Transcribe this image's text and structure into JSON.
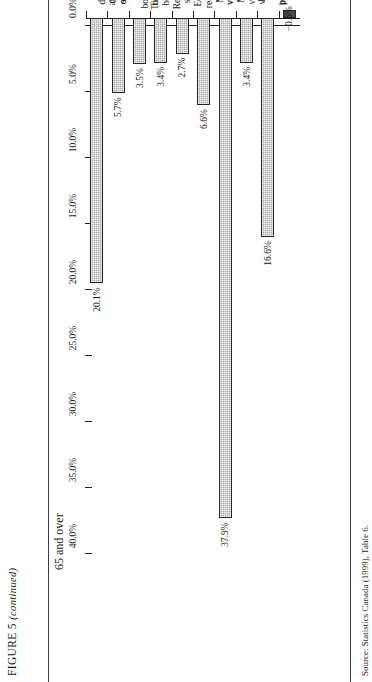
{
  "figure": {
    "caption_main": "FIGURE 5",
    "caption_note": "(continued)"
  },
  "source_note": "Source: Statistics Canada (1999), Table 6.",
  "chart_data": {
    "type": "bar",
    "title": "65 and over",
    "xlabel": "",
    "ylabel": "",
    "ylim": [
      -5.0,
      40.0
    ],
    "ytick_step": 5.0,
    "grid": false,
    "legend": "none",
    "orientation": "vertical-bars-on-rotated-page",
    "categories": [
      "Total\ndeposits\nand cash\non hand",
      "Canada\nsavings\nbonds",
      "Other\nbonds and\nfinancial\nassets",
      "Total stock\nholdings",
      "Registered\nsavings\nplans",
      "Equity in\nreal estate\nand\nvacation",
      "Market\nvalue of\nhome",
      "Market\nvalue of\nvehicles",
      "Equity\nin\nbusiness",
      "Personal\ndebt"
    ],
    "values": [
      20.1,
      5.7,
      3.5,
      3.4,
      2.7,
      6.6,
      37.9,
      3.4,
      16.6,
      -0.6
    ],
    "data_labels": [
      "20.1%",
      "5.7%",
      "3.5%",
      "3.4%",
      "2.7%",
      "6.6%",
      "37.9%",
      "3.4%",
      "16.6%",
      "−0.6%"
    ],
    "tick_labels": [
      "40.0%",
      "35.0%",
      "30.0%",
      "25.0%",
      "20.0%",
      "15.0%",
      "10.0%",
      "5.0%",
      "0.0%",
      "−5.0%"
    ],
    "tick_values": [
      40.0,
      35.0,
      30.0,
      25.0,
      20.0,
      15.0,
      10.0,
      5.0,
      0.0,
      -5.0
    ],
    "bar_fill_color": "#a9a9a9",
    "bar_edge_color": "#262626",
    "axis_color": "#1e1e1e"
  }
}
